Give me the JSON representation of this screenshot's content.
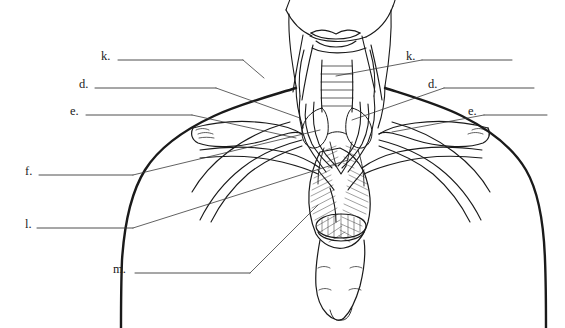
{
  "figure": {
    "type": "anatomy-line-drawing",
    "background_color": "#ffffff",
    "ink_color": "#1a1a1a",
    "width": 565,
    "height": 328
  },
  "labels": {
    "left": [
      {
        "id": "k-left",
        "text": "k.",
        "x": 101,
        "y": 57,
        "line_from": 118,
        "line_to": 243,
        "line_y": 60
      },
      {
        "id": "d-left",
        "text": "d.",
        "x": 79,
        "y": 85,
        "line_from": 95,
        "line_to": 216,
        "line_y": 88
      },
      {
        "id": "e-left",
        "text": "e.",
        "x": 70,
        "y": 112,
        "line_from": 86,
        "line_to": 192,
        "line_y": 115
      },
      {
        "id": "f-left",
        "text": "f.",
        "x": 25,
        "y": 172,
        "line_from": 39,
        "line_to": 133,
        "line_y": 175
      },
      {
        "id": "l-left",
        "text": "l.",
        "x": 25,
        "y": 225,
        "line_from": 37,
        "line_to": 133,
        "line_y": 228
      },
      {
        "id": "m-left",
        "text": "m.",
        "x": 113,
        "y": 270,
        "line_from": 135,
        "line_to": 250,
        "line_y": 273
      }
    ],
    "right": [
      {
        "id": "k-right",
        "text": "k.",
        "x": 406,
        "y": 57,
        "line_from": 422,
        "line_to": 512,
        "line_y": 60
      },
      {
        "id": "d-right",
        "text": "d.",
        "x": 428,
        "y": 85,
        "line_from": 444,
        "line_to": 534,
        "line_y": 88
      },
      {
        "id": "e-right",
        "text": "e.",
        "x": 468,
        "y": 112,
        "line_from": 484,
        "line_to": 547,
        "line_y": 115
      }
    ]
  },
  "leader_lines": [
    {
      "from_label": "k-left",
      "x1": 243,
      "y1": 60,
      "x2": 264,
      "y2": 78
    },
    {
      "from_label": "d-left",
      "x1": 216,
      "y1": 88,
      "x2": 300,
      "y2": 118
    },
    {
      "from_label": "e-left",
      "x1": 192,
      "y1": 115,
      "x2": 296,
      "y2": 138
    },
    {
      "from_label": "f-left",
      "x1": 133,
      "y1": 175,
      "x2": 320,
      "y2": 130
    },
    {
      "from_label": "l-left",
      "x1": 133,
      "y1": 228,
      "x2": 348,
      "y2": 160
    },
    {
      "from_label": "m-left",
      "x1": 250,
      "y1": 273,
      "x2": 318,
      "y2": 205
    },
    {
      "from_label": "k-right",
      "x1": 422,
      "y1": 60,
      "x2": 336,
      "y2": 76
    },
    {
      "from_label": "d-right",
      "x1": 444,
      "y1": 88,
      "x2": 352,
      "y2": 120
    },
    {
      "from_label": "e-right",
      "x1": 484,
      "y1": 115,
      "x2": 392,
      "y2": 132
    }
  ]
}
